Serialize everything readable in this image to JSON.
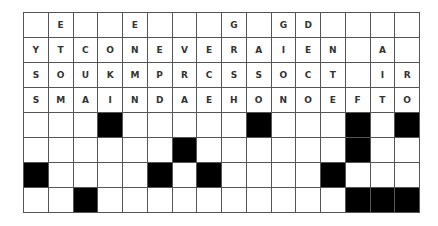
{
  "puzzle": {
    "type": "word-grid",
    "columns": 16,
    "rows": 8,
    "colors": {
      "filled": "#000000",
      "empty": "#ffffff",
      "text": "#333333",
      "border": "#555555"
    },
    "grid": [
      [
        "",
        "E",
        "",
        "",
        "E",
        "",
        "",
        "",
        "G",
        "",
        "G",
        "D",
        "",
        "",
        "",
        ""
      ],
      [
        "Y",
        "T",
        "C",
        "O",
        "N",
        "E",
        "V",
        "E",
        "R",
        "A",
        "I",
        "E",
        "N",
        "",
        "A",
        ""
      ],
      [
        "S",
        "O",
        "U",
        "K",
        "M",
        "P",
        "R",
        "C",
        "S",
        "S",
        "O",
        "C",
        "T",
        "",
        "I",
        "R"
      ],
      [
        "S",
        "M",
        "A",
        "I",
        "N",
        "D",
        "A",
        "E",
        "H",
        "O",
        "N",
        "O",
        "E",
        "F",
        "T",
        "O"
      ],
      [
        "",
        "",
        "",
        "#",
        "",
        "",
        "",
        "",
        "",
        "#",
        "",
        "",
        "",
        "#",
        "",
        "#"
      ],
      [
        "",
        "",
        "",
        "",
        "",
        "",
        "#",
        "",
        "",
        "",
        "",
        "",
        "",
        "#",
        "",
        ""
      ],
      [
        "#",
        "",
        "",
        "",
        "",
        "#",
        "",
        "#",
        "",
        "",
        "",
        "",
        "#",
        "",
        "",
        ""
      ],
      [
        "",
        "",
        "#",
        "",
        "",
        "",
        "",
        "",
        "",
        "",
        "",
        "",
        "",
        "#",
        "#",
        "#"
      ]
    ]
  }
}
